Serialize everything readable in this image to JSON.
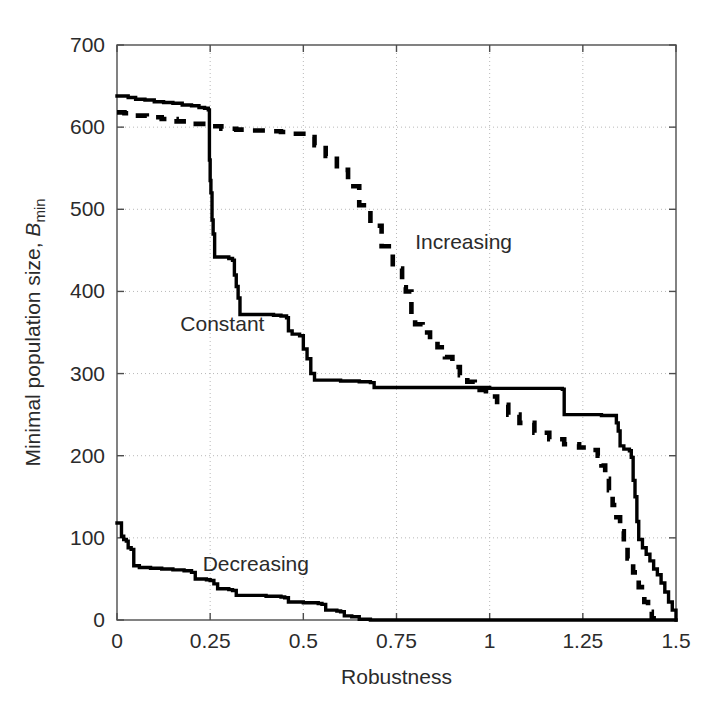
{
  "figure": {
    "background_color": "#ffffff",
    "axis_color": "#4d4d4d",
    "grid_color": "#b8b8b8",
    "series_color": "#000000"
  },
  "axis_titles": {
    "x": "Robustness",
    "y_prefix": "Minimal population size, ",
    "y_symbol": "B",
    "y_subscript": "min"
  },
  "x_tick_labels": [
    "0",
    "0.25",
    "0.5",
    "0.75",
    "1",
    "1.25",
    "1.5"
  ],
  "y_tick_labels": [
    "0",
    "100",
    "200",
    "300",
    "400",
    "500",
    "600",
    "700"
  ],
  "annotations": [
    {
      "text": "Constant",
      "x": 0.17,
      "y": 352
    },
    {
      "text": "Increasing",
      "x": 0.8,
      "y": 452
    },
    {
      "text": "Decreasing",
      "x": 0.23,
      "y": 60
    }
  ],
  "chart_data": {
    "type": "line",
    "title": "",
    "xlabel": "Robustness",
    "ylabel": "Minimal population size, B_min",
    "xlim": [
      0,
      1.5
    ],
    "ylim": [
      0,
      700
    ],
    "xticks": [
      0,
      0.25,
      0.5,
      0.75,
      1,
      1.25,
      1.5
    ],
    "yticks": [
      0,
      100,
      200,
      300,
      400,
      500,
      600,
      700
    ],
    "grid": true,
    "legend_position": "inline-annotations",
    "series": [
      {
        "name": "Constant",
        "style": "solid",
        "color": "#000000",
        "step": "post",
        "points": [
          [
            0.0,
            638
          ],
          [
            0.01,
            638
          ],
          [
            0.03,
            636
          ],
          [
            0.05,
            634
          ],
          [
            0.075,
            633
          ],
          [
            0.1,
            631
          ],
          [
            0.125,
            630
          ],
          [
            0.15,
            629
          ],
          [
            0.175,
            627
          ],
          [
            0.2,
            626
          ],
          [
            0.22,
            624
          ],
          [
            0.235,
            623
          ],
          [
            0.245,
            621
          ],
          [
            0.248,
            560
          ],
          [
            0.25,
            535
          ],
          [
            0.252,
            520
          ],
          [
            0.255,
            487
          ],
          [
            0.258,
            470
          ],
          [
            0.262,
            442
          ],
          [
            0.3,
            440
          ],
          [
            0.31,
            438
          ],
          [
            0.315,
            420
          ],
          [
            0.32,
            406
          ],
          [
            0.325,
            392
          ],
          [
            0.33,
            372
          ],
          [
            0.42,
            371
          ],
          [
            0.44,
            370
          ],
          [
            0.455,
            368
          ],
          [
            0.46,
            352
          ],
          [
            0.47,
            348
          ],
          [
            0.49,
            346
          ],
          [
            0.5,
            330
          ],
          [
            0.51,
            318
          ],
          [
            0.52,
            300
          ],
          [
            0.53,
            292
          ],
          [
            0.6,
            291
          ],
          [
            0.65,
            290
          ],
          [
            0.68,
            289
          ],
          [
            0.69,
            283
          ],
          [
            0.8,
            283
          ],
          [
            0.9,
            283
          ],
          [
            1.0,
            282
          ],
          [
            1.1,
            282
          ],
          [
            1.18,
            282
          ],
          [
            1.195,
            281
          ],
          [
            1.2,
            250
          ],
          [
            1.3,
            249
          ],
          [
            1.33,
            249
          ],
          [
            1.34,
            240
          ],
          [
            1.345,
            230
          ],
          [
            1.35,
            212
          ],
          [
            1.36,
            208
          ],
          [
            1.375,
            206
          ],
          [
            1.38,
            198
          ],
          [
            1.385,
            170
          ],
          [
            1.39,
            150
          ],
          [
            1.395,
            120
          ],
          [
            1.4,
            98
          ],
          [
            1.41,
            88
          ],
          [
            1.42,
            80
          ],
          [
            1.43,
            72
          ],
          [
            1.44,
            62
          ],
          [
            1.45,
            55
          ],
          [
            1.46,
            45
          ],
          [
            1.47,
            34
          ],
          [
            1.48,
            22
          ],
          [
            1.49,
            12
          ],
          [
            1.5,
            0
          ]
        ]
      },
      {
        "name": "Increasing",
        "style": "dashed",
        "color": "#000000",
        "step": "post",
        "points": [
          [
            0.0,
            618
          ],
          [
            0.02,
            617
          ],
          [
            0.05,
            614
          ],
          [
            0.08,
            612
          ],
          [
            0.12,
            610
          ],
          [
            0.16,
            607
          ],
          [
            0.2,
            604
          ],
          [
            0.24,
            601
          ],
          [
            0.28,
            598
          ],
          [
            0.32,
            597
          ],
          [
            0.36,
            596
          ],
          [
            0.4,
            595
          ],
          [
            0.44,
            594
          ],
          [
            0.47,
            592
          ],
          [
            0.5,
            588
          ],
          [
            0.53,
            578
          ],
          [
            0.56,
            565
          ],
          [
            0.59,
            548
          ],
          [
            0.62,
            528
          ],
          [
            0.65,
            505
          ],
          [
            0.68,
            480
          ],
          [
            0.71,
            455
          ],
          [
            0.74,
            428
          ],
          [
            0.765,
            405
          ],
          [
            0.775,
            400
          ],
          [
            0.79,
            372
          ],
          [
            0.8,
            360
          ],
          [
            0.82,
            350
          ],
          [
            0.84,
            340
          ],
          [
            0.86,
            332
          ],
          [
            0.88,
            320
          ],
          [
            0.9,
            308
          ],
          [
            0.92,
            298
          ],
          [
            0.94,
            290
          ],
          [
            0.96,
            280
          ],
          [
            0.99,
            272
          ],
          [
            1.02,
            262
          ],
          [
            1.05,
            250
          ],
          [
            1.08,
            240
          ],
          [
            1.12,
            228
          ],
          [
            1.16,
            220
          ],
          [
            1.2,
            214
          ],
          [
            1.24,
            210
          ],
          [
            1.27,
            207
          ],
          [
            1.29,
            200
          ],
          [
            1.3,
            188
          ],
          [
            1.31,
            172
          ],
          [
            1.32,
            158
          ],
          [
            1.33,
            140
          ],
          [
            1.34,
            125
          ],
          [
            1.35,
            108
          ],
          [
            1.36,
            92
          ],
          [
            1.37,
            75
          ],
          [
            1.385,
            58
          ],
          [
            1.4,
            40
          ],
          [
            1.415,
            22
          ],
          [
            1.425,
            10
          ],
          [
            1.435,
            2
          ],
          [
            1.44,
            0
          ]
        ]
      },
      {
        "name": "Decreasing",
        "style": "solid",
        "color": "#000000",
        "step": "post",
        "points": [
          [
            0.0,
            118
          ],
          [
            0.008,
            118
          ],
          [
            0.012,
            102
          ],
          [
            0.018,
            98
          ],
          [
            0.025,
            96
          ],
          [
            0.03,
            88
          ],
          [
            0.038,
            86
          ],
          [
            0.045,
            66
          ],
          [
            0.06,
            64
          ],
          [
            0.09,
            63
          ],
          [
            0.12,
            62
          ],
          [
            0.15,
            61
          ],
          [
            0.18,
            60
          ],
          [
            0.2,
            58
          ],
          [
            0.21,
            50
          ],
          [
            0.24,
            49
          ],
          [
            0.25,
            48
          ],
          [
            0.26,
            44
          ],
          [
            0.27,
            38
          ],
          [
            0.3,
            37
          ],
          [
            0.31,
            36
          ],
          [
            0.32,
            30
          ],
          [
            0.4,
            29
          ],
          [
            0.44,
            28
          ],
          [
            0.45,
            27
          ],
          [
            0.46,
            22
          ],
          [
            0.5,
            21
          ],
          [
            0.54,
            20
          ],
          [
            0.55,
            19
          ],
          [
            0.56,
            12
          ],
          [
            0.59,
            11
          ],
          [
            0.6,
            10
          ],
          [
            0.61,
            5
          ],
          [
            0.63,
            4
          ],
          [
            0.65,
            1
          ],
          [
            0.68,
            0
          ],
          [
            1.0,
            0
          ],
          [
            1.5,
            0
          ]
        ]
      }
    ]
  }
}
